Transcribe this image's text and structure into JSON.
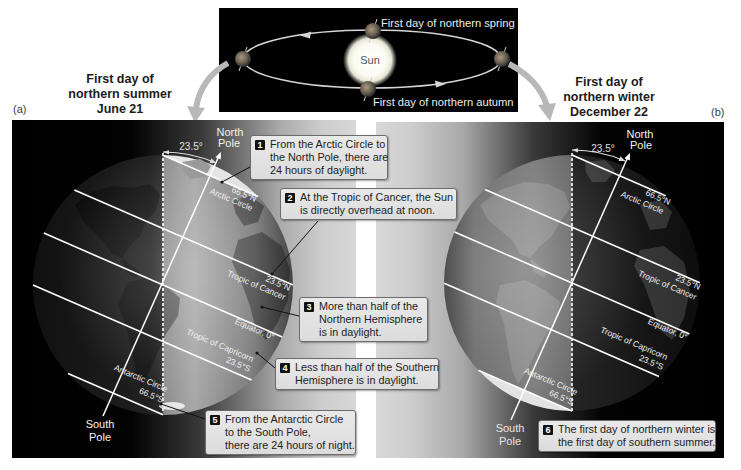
{
  "orbit": {
    "sun_label": "Sun",
    "spring_label": "First day of northern spring",
    "autumn_label": "First day of northern autumn"
  },
  "panels": [
    {
      "letter": "(a)",
      "title": [
        "First day of",
        "northern summer",
        "June 21"
      ],
      "north_pole": [
        "North",
        "Pole"
      ],
      "south_pole": [
        "South",
        "Pole"
      ],
      "tilt": "23.5°",
      "latitudes": {
        "arctic": {
          "value": "66.5°N",
          "name": "Arctic Circle"
        },
        "cancer": {
          "value": "23.5°N",
          "name": "Tropic of Cancer"
        },
        "equator": {
          "name": "Equator, 0°"
        },
        "capricorn": {
          "value": "23.5°S",
          "name": "Tropic of Capricorn"
        },
        "antarctic": {
          "value": "66.5°S",
          "name": "Antarctic Circle"
        }
      },
      "callouts": [
        {
          "number": "1",
          "lines": [
            "From the Arctic Circle to",
            "the North Pole, there are",
            "24 hours of daylight."
          ]
        },
        {
          "number": "2",
          "lines": [
            "At the Tropic of Cancer, the Sun",
            "is directly overhead at noon."
          ]
        },
        {
          "number": "3",
          "lines": [
            "More than half of the",
            "Northern Hemisphere",
            "is in daylight."
          ]
        },
        {
          "number": "4",
          "lines": [
            "Less than half of the Southern",
            "Hemisphere is in daylight."
          ]
        },
        {
          "number": "5",
          "lines": [
            "From the Antarctic Circle",
            "to the South Pole,",
            "there are 24 hours of night."
          ]
        }
      ]
    },
    {
      "letter": "(b)",
      "title": [
        "First day of",
        "northern winter",
        "December 22"
      ],
      "north_pole": [
        "North",
        "Pole"
      ],
      "south_pole": [
        "South",
        "Pole"
      ],
      "tilt": "23.5°",
      "latitudes": {
        "arctic": {
          "value": "66.5°N",
          "name": "Arctic Circle"
        },
        "cancer": {
          "value": "23.5°N",
          "name": "Tropic of Cancer"
        },
        "equator": {
          "name": "Equator, 0°"
        },
        "capricorn": {
          "value": "23.5°S",
          "name": "Tropic of Capricorn"
        },
        "antarctic": {
          "value": "66.5°S",
          "name": "Antarctic Circle"
        }
      },
      "callouts": [
        {
          "number": "6",
          "lines": [
            "The first day of northern winter is",
            "the first day of southern summer."
          ]
        }
      ]
    }
  ],
  "colors": {
    "space": "#000000",
    "daylight_gray": "#d8d8d8",
    "callout_fill": "#e2e2e2",
    "callout_border": "#6c6c6c",
    "badge": "#111111",
    "latitude_lines": "#ffffff",
    "transition_arrow": "#b8b8b8"
  }
}
